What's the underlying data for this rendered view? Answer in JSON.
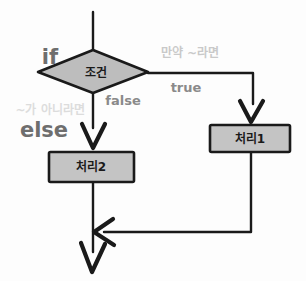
{
  "diagram": {
    "background_color": "#fdfdfd",
    "line_color": "#1a1a1a",
    "node_fill": "#c0c0c0",
    "node_stroke": "#1a1a1a"
  },
  "nodes": {
    "decision": {
      "label": "조건",
      "shape": "diamond"
    },
    "process_true": {
      "label": "처리1",
      "shape": "rectangle"
    },
    "process_false": {
      "label": "처리2",
      "shape": "rectangle"
    }
  },
  "keywords": {
    "if": {
      "label": "if",
      "color": "#6e6e6e"
    },
    "else": {
      "label": "else",
      "color": "#6e6e6e"
    }
  },
  "edges": {
    "true_branch": {
      "label": "true",
      "color": "#8a8a8a"
    },
    "false_branch": {
      "label": "false",
      "color": "#8a8a8a"
    }
  },
  "annotations": {
    "if_meaning": {
      "label": "만약 ~라면",
      "color": "#c9c9c9"
    },
    "else_meaning": {
      "label": "~가 아니라면",
      "color": "#dcdcdc"
    }
  }
}
